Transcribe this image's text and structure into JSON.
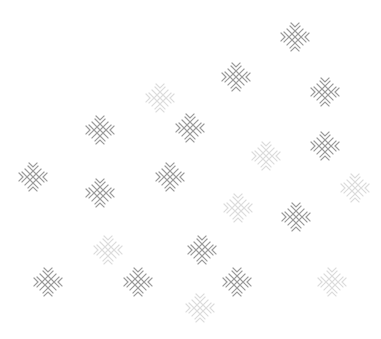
{
  "background": "#ffffff",
  "colors": {
    "dark": "#9a9a9a",
    "faint": "#dcdcdc"
  },
  "icon": "snowflake-icon",
  "flakes": [
    {
      "x": 295,
      "y": 37,
      "tone": "dark"
    },
    {
      "x": 236,
      "y": 77,
      "tone": "dark"
    },
    {
      "x": 160,
      "y": 98,
      "tone": "faint"
    },
    {
      "x": 325,
      "y": 92,
      "tone": "dark"
    },
    {
      "x": 100,
      "y": 130,
      "tone": "dark"
    },
    {
      "x": 190,
      "y": 128,
      "tone": "dark"
    },
    {
      "x": 325,
      "y": 146,
      "tone": "dark"
    },
    {
      "x": 266,
      "y": 156,
      "tone": "faint"
    },
    {
      "x": 33,
      "y": 177,
      "tone": "dark"
    },
    {
      "x": 170,
      "y": 177,
      "tone": "dark"
    },
    {
      "x": 100,
      "y": 193,
      "tone": "dark"
    },
    {
      "x": 355,
      "y": 188,
      "tone": "faint"
    },
    {
      "x": 238,
      "y": 208,
      "tone": "faint"
    },
    {
      "x": 296,
      "y": 217,
      "tone": "dark"
    },
    {
      "x": 108,
      "y": 250,
      "tone": "faint"
    },
    {
      "x": 202,
      "y": 250,
      "tone": "dark"
    },
    {
      "x": 48,
      "y": 282,
      "tone": "dark"
    },
    {
      "x": 138,
      "y": 282,
      "tone": "dark"
    },
    {
      "x": 237,
      "y": 282,
      "tone": "dark"
    },
    {
      "x": 332,
      "y": 282,
      "tone": "faint"
    },
    {
      "x": 200,
      "y": 308,
      "tone": "faint"
    }
  ]
}
